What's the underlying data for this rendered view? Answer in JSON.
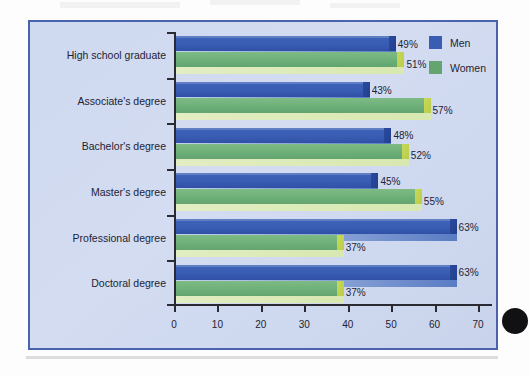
{
  "chart_data": {
    "type": "bar",
    "orientation": "horizontal",
    "title": "",
    "xlabel": "",
    "ylabel": "",
    "xlim": [
      0,
      70
    ],
    "xticks": [
      0,
      10,
      20,
      30,
      40,
      50,
      60,
      70
    ],
    "grid": false,
    "legend_position": "top-right",
    "value_suffix": "%",
    "categories": [
      "High school graduate",
      "Associate's degree",
      "Bachelor's degree",
      "Master's degree",
      "Professional degree",
      "Doctoral degree"
    ],
    "series": [
      {
        "name": "Men",
        "color": "#3a5db4",
        "values": [
          49,
          43,
          48,
          45,
          63,
          63
        ],
        "labels": [
          "49%",
          "43%",
          "48%",
          "45%",
          "63%",
          "63%"
        ]
      },
      {
        "name": "Women",
        "color": "#63a470",
        "values": [
          51,
          57,
          52,
          55,
          37,
          37
        ],
        "labels": [
          "51%",
          "57%",
          "52%",
          "55%",
          "37%",
          "37%"
        ]
      }
    ]
  },
  "legend": {
    "items": [
      {
        "label": "Men",
        "key": "men"
      },
      {
        "label": "Women",
        "key": "women"
      }
    ]
  },
  "colors": {
    "figure_background": "#ccd7ee",
    "figure_border": "#4a63ad",
    "men": "#3a5db4",
    "men_cap": "#23408d",
    "women": "#63a470",
    "women_cap": "#c3d454",
    "axis": "#2a2a33",
    "text": "#1d2333"
  }
}
